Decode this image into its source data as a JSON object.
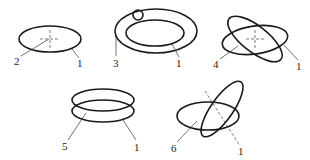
{
  "diagram": {
    "type": "ring-deformation-modes",
    "background": "#ffffff",
    "line_color": "#1a1a1a",
    "figures": [
      {
        "id": "a",
        "description": "single ellipse with center cross",
        "labels": {
          "left": "2",
          "right": "1"
        }
      },
      {
        "id": "b",
        "description": "concentric double ellipse with small circle on ring",
        "labels": {
          "left": "3",
          "right": "1"
        }
      },
      {
        "id": "c",
        "description": "two crossed ellipses with center cross",
        "labels": {
          "left": "4",
          "right": "1"
        }
      },
      {
        "id": "d",
        "description": "two stacked parallel ellipses",
        "labels": {
          "left": "5",
          "right": "1"
        }
      },
      {
        "id": "e",
        "description": "two intersecting tilted ellipses with dashed axis",
        "labels": {
          "left": "6",
          "right": "1"
        }
      }
    ]
  }
}
